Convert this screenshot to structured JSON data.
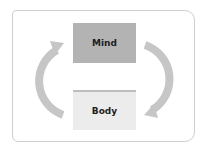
{
  "diagram": {
    "type": "cycle",
    "nodes": [
      {
        "id": "mind",
        "label": "Mind",
        "fill": "#b3b3b3"
      },
      {
        "id": "body",
        "label": "Body",
        "fill": "#ececec"
      }
    ],
    "edges": [
      {
        "from": "mind",
        "to": "body",
        "side": "right",
        "icon": "curved-arrow-clockwise"
      },
      {
        "from": "body",
        "to": "mind",
        "side": "left",
        "icon": "curved-arrow-clockwise"
      }
    ],
    "colors": {
      "arrow": "#c6c6c6",
      "frame_border": "#cfcfcf",
      "text": "#1e1e1e"
    }
  }
}
